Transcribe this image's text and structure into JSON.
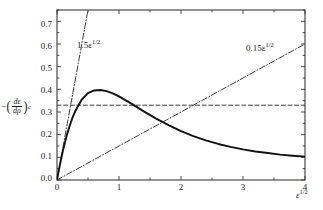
{
  "chart_data": {
    "type": "line",
    "title": "",
    "xlabel": "e^1/2",
    "ylabel": "-(de/dp)_c",
    "xlim": [
      0,
      4
    ],
    "ylim": [
      0,
      0.75
    ],
    "grid": false,
    "legend": "none",
    "x_ticks": [
      "0",
      "1",
      "2",
      "3",
      "4"
    ],
    "x_tick_values": [
      0,
      1,
      2,
      3,
      4
    ],
    "x_minor_ticks": [
      0.5,
      1.5,
      2.5,
      3.5
    ],
    "y_ticks": [
      "0.0",
      "0.1",
      "0.2",
      "0.3",
      "0.4",
      "0.5",
      "0.6",
      "0.7"
    ],
    "y_tick_values": [
      0.0,
      0.1,
      0.2,
      0.3,
      0.4,
      0.5,
      0.6,
      0.7
    ],
    "y_minor_ticks": [
      0.05,
      0.15,
      0.25,
      0.35,
      0.45,
      0.55,
      0.65,
      0.75
    ],
    "series": [
      {
        "name": "main-curve",
        "style": "solid",
        "color": "#111111",
        "x": [
          0.0,
          0.05,
          0.1,
          0.15,
          0.2,
          0.25,
          0.3,
          0.4,
          0.5,
          0.6,
          0.7,
          0.8,
          0.9,
          1.0,
          1.2,
          1.4,
          1.6,
          1.8,
          2.0,
          2.2,
          2.4,
          2.6,
          2.8,
          3.0,
          3.2,
          3.4,
          3.6,
          3.8,
          4.0
        ],
        "y": [
          0.0,
          0.072,
          0.135,
          0.19,
          0.235,
          0.275,
          0.307,
          0.355,
          0.383,
          0.395,
          0.397,
          0.392,
          0.382,
          0.369,
          0.337,
          0.303,
          0.271,
          0.242,
          0.216,
          0.194,
          0.175,
          0.159,
          0.146,
          0.135,
          0.126,
          0.119,
          0.112,
          0.107,
          0.103
        ]
      },
      {
        "name": "upper-bound-line",
        "style": "dash-dot",
        "color": "#333333",
        "slope": 1.5,
        "x": [
          0.0,
          0.5
        ],
        "y": [
          0.0,
          0.75
        ]
      },
      {
        "name": "lower-bound-line",
        "style": "dash-dot",
        "color": "#333333",
        "slope": 0.15,
        "x": [
          0.0,
          4.0
        ],
        "y": [
          0.0,
          0.6
        ]
      },
      {
        "name": "asymptote-line",
        "style": "dashed",
        "color": "#333333",
        "value": 0.33,
        "x": [
          0.0,
          4.0
        ],
        "y": [
          0.33,
          0.33
        ]
      }
    ],
    "annotations": [
      {
        "name": "upper-bound-label",
        "text_prefix": "1.5ε",
        "text_sup": "1/2",
        "x_px": 77,
        "y_px": 41
      },
      {
        "name": "lower-bound-label",
        "text_prefix": "0.15ε",
        "text_sup": "1/2",
        "x_px": 246,
        "y_px": 44
      }
    ]
  },
  "axes": {
    "x_title_prefix": "ε",
    "x_title_sup": "1/2",
    "y_title_minus": "−",
    "y_title_num": "dε",
    "y_title_den": "dρ",
    "y_title_sub": "c",
    "y_title_paren_open": "(",
    "y_title_paren_close": ")"
  },
  "ticks": {
    "y": [
      {
        "label": "0.7",
        "top": 24
      },
      {
        "label": "0.6",
        "top": 46
      },
      {
        "label": "0.5",
        "top": 68
      },
      {
        "label": "0.4",
        "top": 90
      },
      {
        "label": "0.3",
        "top": 112
      },
      {
        "label": "0.2",
        "top": 134
      },
      {
        "label": "0.1",
        "top": 156
      },
      {
        "label": "0.0",
        "top": 178
      }
    ],
    "x": [
      {
        "label": "0",
        "left": 57
      },
      {
        "label": "1",
        "left": 119
      },
      {
        "label": "2",
        "left": 181
      },
      {
        "label": "3",
        "left": 243
      },
      {
        "label": "4",
        "left": 305
      }
    ]
  },
  "colors": {
    "axis": "#3a3a3a",
    "curve": "#111111",
    "dashdot": "#333333",
    "dashed": "#333333",
    "text": "#1a1a1a",
    "background": "#ffffff"
  }
}
